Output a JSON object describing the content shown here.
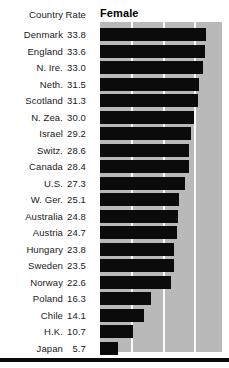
{
  "header": {
    "country_label": "Country",
    "rate_label": "Rate",
    "series_label": "Female"
  },
  "style": {
    "panel_color": "#b9b9b9",
    "bar_color": "#0b0b0b",
    "gridline_color": "#fafafa",
    "text_color": "#1a1a1a",
    "rule_color": "#0a0a0a"
  },
  "chart_data": {
    "type": "bar",
    "orientation": "horizontal",
    "title": "Female",
    "xlabel": "Rate",
    "ylabel": "Country",
    "grid": true,
    "gridlines_at": [
      10,
      20,
      30
    ],
    "xlim": [
      0,
      39
    ],
    "legend": [],
    "categories": [
      "Denmark",
      "England",
      "N. Ire.",
      "Neth.",
      "Scotland",
      "N. Zea.",
      "Israel",
      "Switz.",
      "Canada",
      "U.S.",
      "W. Ger.",
      "Australia",
      "Austria",
      "Hungary",
      "Sweden",
      "Norway",
      "Poland",
      "Chile",
      "H.K.",
      "Japan"
    ],
    "values": [
      33.8,
      33.6,
      33.0,
      31.5,
      31.3,
      30.0,
      29.2,
      28.6,
      28.4,
      27.3,
      25.1,
      24.8,
      24.7,
      23.8,
      23.5,
      22.6,
      16.3,
      14.1,
      10.7,
      5.7
    ],
    "value_labels": [
      "33.8",
      "33.6",
      "33.0",
      "31.5",
      "31.3",
      "30.0",
      "29.2",
      "28.6",
      "28.4",
      "27.3",
      "25.1",
      "24.8",
      "24.7",
      "23.8",
      "23.5",
      "22.6",
      "16.3",
      "14.1",
      "10.7",
      "5.7"
    ]
  }
}
